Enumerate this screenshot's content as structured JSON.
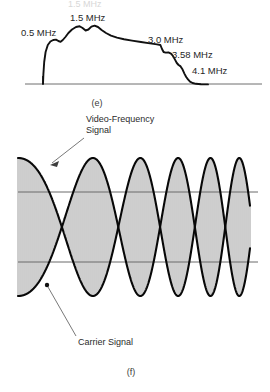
{
  "page": {
    "width": 270,
    "height": 392,
    "background": "#ffffff",
    "ink": "#111111",
    "rule_color": "#6a6a6a"
  },
  "cropped_header_text": "1.5 MHz",
  "figure_e": {
    "caption": "(e)",
    "baseline": {
      "x1": 25,
      "x2": 262,
      "y": 84
    },
    "labels": [
      {
        "id": "f-1-5",
        "text": "1.5 MHz",
        "x": 70,
        "y": 21,
        "anchor": "start"
      },
      {
        "id": "f-0-5",
        "text": "0.5 MHz",
        "x": 21,
        "y": 36,
        "anchor": "start"
      },
      {
        "id": "f-3-0",
        "text": "3.0 MHz",
        "x": 148,
        "y": 43,
        "anchor": "start"
      },
      {
        "id": "f-3-58",
        "text": "3.58 MHz",
        "x": 172,
        "y": 58,
        "anchor": "start"
      },
      {
        "id": "f-4-1",
        "text": "4.1 MHz",
        "x": 192,
        "y": 74,
        "anchor": "start"
      }
    ],
    "marker_tick": {
      "x": 43,
      "y1": 76,
      "y2": 84
    },
    "spectrum": {
      "type": "line",
      "title": "Video-frequency spectrum envelope",
      "xlabel": "Frequency (MHz)",
      "ylabel": "Relative amplitude",
      "xlim": [
        0,
        5.2
      ],
      "ylim": [
        0,
        1
      ],
      "grid": false,
      "legend": "none",
      "annotated_frequencies_mhz": [
        0.5,
        1.5,
        3.0,
        3.58,
        4.1
      ],
      "x_mhz": [
        0.15,
        0.3,
        0.42,
        0.5,
        0.62,
        0.78,
        0.95,
        1.12,
        1.28,
        1.4,
        1.5,
        1.6,
        1.72,
        1.85,
        2.0,
        2.2,
        2.45,
        2.7,
        2.9,
        3.0,
        3.1,
        3.22,
        3.35,
        3.45,
        3.52,
        3.58,
        3.68,
        3.8,
        3.95,
        4.05,
        4.1,
        4.25,
        4.6,
        5.1
      ],
      "amplitude": [
        0.02,
        0.4,
        0.62,
        0.66,
        0.62,
        0.66,
        0.72,
        0.8,
        0.88,
        0.95,
        0.9,
        0.95,
        0.88,
        0.8,
        0.74,
        0.68,
        0.63,
        0.59,
        0.57,
        0.56,
        0.48,
        0.46,
        0.45,
        0.43,
        0.4,
        0.32,
        0.26,
        0.2,
        0.13,
        0.08,
        0.06,
        0.03,
        0.01,
        0.01
      ],
      "path_px": "M 43 84 L 43.4 74 L 44.2 62 L 45.6 52 L 47.8 45 L 50.4 41.5 L 53.2 40 L 56 39.6 L 58.4 41 L 60.6 41.8 L 62.8 40 L 65.4 37 L 68.4 33 L 72 29.5 L 76 27 L 79.6 26.2 L 82.6 28 L 85.6 30.5 L 88.4 29.5 L 91.4 26.6 L 94.6 25.6 L 98 27 L 101.6 30 L 106 33 L 111 35.6 L 117 37.6 L 124 39.2 L 132 40.6 L 141 42 L 150 43.4 L 157 44.4 L 160.4 45 L 162 49 L 163.6 52 L 165.6 52.6 L 168.4 52.4 L 171 53.6 L 173 56 L 175 59.6 L 176.8 63 L 178.6 65 L 180.6 66.4 L 182.6 69.6 L 184.4 73.6 L 186.2 77 L 188 79.4 L 190 81.6 L 192.6 83 L 196 83.8 L 201 84.2 L 208 84.4"
    }
  },
  "figure_f": {
    "caption": "(f)",
    "annotations": [
      {
        "id": "video-frequency-signal",
        "line1": "Video-Frequency",
        "line2": "Signal",
        "x": 86,
        "y": 122,
        "leader": {
          "x1": 84,
          "y1": 138,
          "x2": 50,
          "y2": 165
        }
      },
      {
        "id": "carrier-signal",
        "line1": "Carrier Signal",
        "line2": "",
        "x": 78,
        "y": 344,
        "leader": {
          "x1": 76,
          "y1": 336,
          "x2": 48,
          "y2": 286
        }
      }
    ],
    "reference_lines": [
      {
        "id": "upper-reference-line",
        "x1": 18,
        "x2": 258,
        "y": 192
      },
      {
        "id": "lower-reference-line",
        "x1": 18,
        "x2": 258,
        "y": 262
      }
    ],
    "marker_dot": {
      "x": 47,
      "y": 285,
      "r": 2.2
    },
    "waveform": {
      "type": "line",
      "title": "Amplitude-modulated carrier with increasing modulation frequency",
      "x_start_px": 18,
      "x_end_px": 250,
      "center_y_px": 227,
      "amplitude_px": 69,
      "envelope_cycles_start": 1.0,
      "envelope_cycles_end": 4.4,
      "carrier_line_spacing_px": 2.0,
      "description": "Two mirror-image swept-frequency sinusoidal envelopes cross repeatedly; vertical carrier lines fill the space between them."
    }
  }
}
